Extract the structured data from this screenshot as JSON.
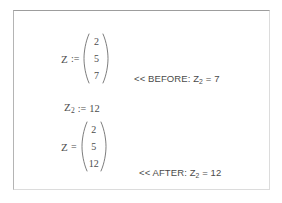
{
  "document": {
    "type": "math-worksheet-excerpt",
    "text_color": "#4c4c4c",
    "border_color": "#9d9d9d",
    "background": "#ffffff"
  },
  "before_expression": {
    "variable": "Z",
    "operator": ":=",
    "vector": [
      "2",
      "5",
      "7"
    ]
  },
  "element_assignment": {
    "variable": "Z",
    "subscript": "2",
    "operator": ":=",
    "value": "12"
  },
  "after_expression": {
    "variable": "Z",
    "operator": "=",
    "vector": [
      "2",
      "5",
      "12"
    ]
  },
  "notes": {
    "before": {
      "marker": "<<",
      "label": "BEFORE:",
      "variable": "Z",
      "subscript": "2",
      "equals": "=",
      "value": "7"
    },
    "after": {
      "marker": "<<",
      "label": "AFTER:",
      "variable": "Z",
      "subscript": "2",
      "equals": "=",
      "value": "12"
    }
  }
}
